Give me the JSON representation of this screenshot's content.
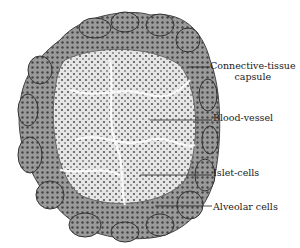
{
  "figure": {
    "colors": {
      "tissue_dark": "#3a3a3a",
      "tissue_mid": "#8a8a8a",
      "tissue_light": "#d8d8d8",
      "background": "#ffffff"
    }
  },
  "labels": {
    "capsule_line1": "Connective-tissue",
    "capsule_line2": "capsule",
    "blood_vessel": "Blood-vessel",
    "islet_cells": "Islet-cells",
    "alveolar_cells": "Alveolar cells"
  }
}
